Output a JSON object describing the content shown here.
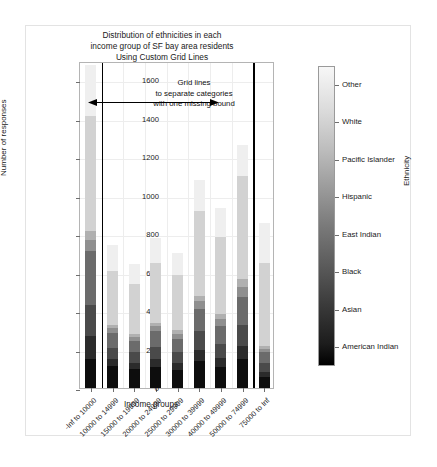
{
  "chart_data": {
    "type": "bar",
    "stacked": true,
    "title": "Distribution of ethnicities in each income group of SF bay area residents Using Custom Grid Lines",
    "title_lines": [
      "Distribution of ethnicities in each",
      "income group of SF bay area residents",
      "Using Custom Grid Lines"
    ],
    "xlabel": "Income groups",
    "ylabel": "Number of responses",
    "ylim": [
      0,
      1700
    ],
    "yticks": [
      0,
      200,
      400,
      600,
      800,
      1000,
      1200,
      1400,
      1600
    ],
    "grid": true,
    "legend_position": "right-colorbar",
    "legend_title": "Ethnicity",
    "categories": [
      "-Inf to 10000",
      "10000 to 14999",
      "15000 to 19999",
      "20000 to 24999",
      "25000 to 29999",
      "30000 to 39999",
      "40000 to 49999",
      "50000 to 74999",
      "75000 to  Inf"
    ],
    "totals": [
      1680,
      745,
      645,
      780,
      700,
      1080,
      935,
      1265,
      860
    ],
    "series": [
      {
        "name": "American Indian",
        "color": "#0d0d0d",
        "values": [
          150,
          115,
          100,
          110,
          95,
          140,
          110,
          150,
          55
        ]
      },
      {
        "name": "Asian",
        "color": "#2b2b2b",
        "values": [
          120,
          35,
          30,
          40,
          35,
          60,
          45,
          70,
          30
        ]
      },
      {
        "name": "Black",
        "color": "#4a4a4a",
        "values": [
          160,
          60,
          55,
          65,
          55,
          95,
          75,
          110,
          45
        ]
      },
      {
        "name": "East Indian",
        "color": "#6b6b6b",
        "values": [
          285,
          75,
          60,
          80,
          70,
          115,
          95,
          145,
          55
        ]
      },
      {
        "name": "Hispanic",
        "color": "#8f8f8f",
        "values": [
          55,
          25,
          20,
          25,
          25,
          40,
          35,
          50,
          20
        ]
      },
      {
        "name": "Pacific Islander",
        "color": "#b0b0b0",
        "values": [
          45,
          20,
          15,
          20,
          20,
          30,
          25,
          40,
          15
        ]
      },
      {
        "name": "White",
        "color": "#d2d2d2",
        "values": [
          600,
          280,
          260,
          310,
          290,
          440,
          400,
          540,
          430
        ]
      },
      {
        "name": "Other",
        "color": "#efefef",
        "values": [
          265,
          135,
          105,
          130,
          110,
          160,
          150,
          160,
          210
        ]
      }
    ],
    "colorbar_labels": [
      "American Indian",
      "Asian",
      "Black",
      "East Indian",
      "Hispanic",
      "Pacific Islander",
      "White",
      "Other"
    ],
    "annotation": {
      "lines": [
        "Grid lines",
        "to separate categories",
        "with one missing bound"
      ],
      "arrow": "double-headed"
    },
    "custom_gridlines": {
      "note": "two heavy vertical grid lines separating categories",
      "positions_after_category_index": [
        0,
        7
      ]
    }
  }
}
